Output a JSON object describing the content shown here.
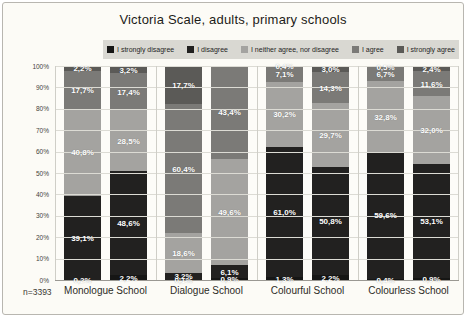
{
  "footer": {
    "n_label": "n=3393"
  },
  "colors": {
    "page_bg": "#fcfbf6",
    "legend_strip_bg": "#d9d8d2",
    "plot_bg": "#fdfcf8",
    "grid": "#dcdbd4"
  },
  "chart_data": {
    "type": "bar",
    "stacked": true,
    "orientation": "vertical",
    "title": "Victoria Scale, adults, primary schools",
    "legend": [
      "I strongly disagree",
      "I disagree",
      "I neither agree, nor disagree",
      "I agree",
      "I strongly agree"
    ],
    "legend_position": "top",
    "series_colors": [
      "#161615",
      "#222120",
      "#a4a3a0",
      "#7b7a77",
      "#5b5a57"
    ],
    "categories": [
      "Monologue School",
      "Dialogue School",
      "Colourful School",
      "Colourless School"
    ],
    "y_ticks": [
      "100%",
      "90%",
      "80%",
      "70%",
      "60%",
      "50%",
      "40%",
      "30%",
      "20%",
      "10%",
      "0%"
    ],
    "ylim": [
      0,
      100
    ],
    "grid": true,
    "note": "n=3393",
    "groups": [
      {
        "category": "Monologue School",
        "bars": [
          {
            "values": [
              0.2,
              39.1,
              40.8,
              17.7,
              2.2
            ],
            "labels": [
              "0,2%",
              "39,1%",
              "40,8%",
              "17,7%",
              "2,2%"
            ]
          },
          {
            "values": [
              2.2,
              48.6,
              28.5,
              17.4,
              3.2
            ],
            "labels": [
              "2,2%",
              "48,6%",
              "28,5%",
              "17,4%",
              "3,2%"
            ]
          }
        ]
      },
      {
        "category": "Dialogue School",
        "bars": [
          {
            "values": [
              0.1,
              3.2,
              18.6,
              60.4,
              17.7
            ],
            "labels": [
              "0,1%",
              "3,2%",
              "18,6%",
              "60,4%",
              "17,7%"
            ]
          },
          {
            "values": [
              0.9,
              6.1,
              49.6,
              43.4,
              0
            ],
            "labels": [
              "0,9%",
              "6,1%",
              "49,6%",
              "43,4%",
              ""
            ]
          }
        ]
      },
      {
        "category": "Colourful School",
        "bars": [
          {
            "values": [
              1.3,
              61.0,
              30.2,
              7.1,
              0.4
            ],
            "labels": [
              "1,3%",
              "61,0%",
              "30,2%",
              "7,1%",
              "0,4%"
            ]
          },
          {
            "values": [
              2.2,
              50.8,
              29.7,
              14.3,
              3.0
            ],
            "labels": [
              "2,2%",
              "50,8%",
              "29,7%",
              "14,3%",
              "3,0%"
            ]
          }
        ]
      },
      {
        "category": "Colourless School",
        "bars": [
          {
            "values": [
              0.4,
              59.6,
              32.8,
              6.7,
              0.5
            ],
            "labels": [
              "0,4%",
              "59,6%",
              "32,8%",
              "6,7%",
              "0,5%"
            ]
          },
          {
            "values": [
              0.9,
              53.1,
              32.0,
              11.6,
              2.4
            ],
            "labels": [
              "0,9%",
              "53,1%",
              "32,0%",
              "11,6%",
              "2,4%"
            ]
          }
        ]
      }
    ]
  }
}
